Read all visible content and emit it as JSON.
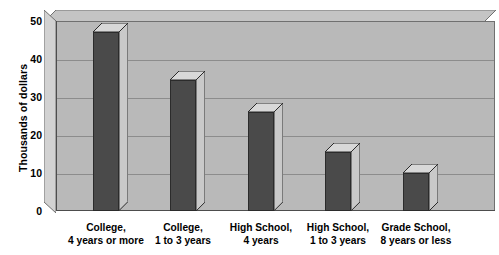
{
  "chart_data": {
    "type": "bar",
    "title": "",
    "subtitle": "",
    "xlabel": "",
    "ylabel": "Thousands of dollars",
    "ylim": [
      0,
      50
    ],
    "yticks": [
      0,
      10,
      20,
      30,
      40,
      50
    ],
    "ytick_labels": [
      "0",
      "10",
      "20",
      "30",
      "40",
      "50"
    ],
    "grid": true,
    "legend": false,
    "legend_position": "none",
    "style": "3d-bar",
    "categories": [
      "College, 4 years or more",
      "College, 1 to 3 years",
      "High School, 4 years",
      "High School, 1 to 3 years",
      "Grade School, 8 years or less"
    ],
    "category_lines": [
      {
        "line1": "College,",
        "line2": "4 years or more"
      },
      {
        "line1": "College,",
        "line2": "1 to 3 years"
      },
      {
        "line1": "High School,",
        "line2": "4 years"
      },
      {
        "line1": "High School,",
        "line2": "1 to 3 years"
      },
      {
        "line1": "Grade School,",
        "line2": "8 years or less"
      }
    ],
    "values": [
      47,
      34.5,
      26,
      15.5,
      10
    ],
    "bar_color": "#4a4a4a",
    "plot_background": "#b9b9b9",
    "gridline_color": "#8c8c8c",
    "text_color": "#000000"
  },
  "colors": {
    "page_background": "#ffffff",
    "plot_face": "#b9b9b9",
    "plot_top_face": "#c4c4c4",
    "plot_left_face": "#d2d2d2",
    "plot_border": "#707070",
    "bar_front": "#4a4a4a",
    "bar_top_cap": "#d8d8d8",
    "bar_side_cap": "#c9c9c9",
    "bar_outline": "#2b2b2b",
    "gridline": "#8c8c8c",
    "axis": "#4d4d4d",
    "text": "#000000"
  }
}
